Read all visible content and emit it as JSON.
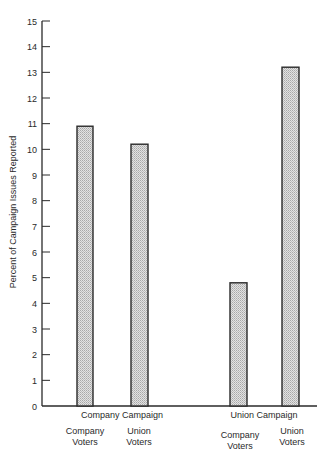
{
  "chart_data": {
    "type": "bar",
    "title": "",
    "xlabel": "",
    "ylabel": "Percent of Campaign Issues Reported",
    "ylim": [
      0,
      15
    ],
    "yticks": [
      0,
      1,
      2,
      3,
      4,
      5,
      6,
      7,
      8,
      9,
      10,
      11,
      12,
      13,
      14,
      15
    ],
    "grid": false,
    "legend": null,
    "groups": [
      {
        "label": "Company Campaign",
        "categories": [
          "Company Voters",
          "Union Voters"
        ],
        "values": [
          10.9,
          10.2
        ]
      },
      {
        "label": "Union Campaign",
        "categories": [
          "Company Voters",
          "Union Voters"
        ],
        "values": [
          4.8,
          13.2
        ]
      }
    ],
    "bars": [
      {
        "group": "Company Campaign",
        "category": "Company Voters",
        "value": 10.9
      },
      {
        "group": "Company Campaign",
        "category": "Union Voters",
        "value": 10.2
      },
      {
        "group": "Union Campaign",
        "category": "Company Voters",
        "value": 4.8
      },
      {
        "group": "Union Campaign",
        "category": "Union Voters",
        "value": 13.2
      }
    ]
  },
  "labels": {
    "ylabel": "Percent of Campaign Issues Reported",
    "group1": "Company Campaign",
    "group2": "Union Campaign",
    "cat1_line1": "Company",
    "cat1_line2": "Voters",
    "cat2_line1": "Union",
    "cat2_line2": "Voters",
    "cat3_line1": "Company",
    "cat3_line2": "Voters",
    "cat4_line1": "Union",
    "cat4_line2": "Voters"
  },
  "colors": {
    "bar_fill": "#cfcfcf",
    "bar_stroke": "#2a2a2a",
    "axis": "#2a2a2a"
  }
}
